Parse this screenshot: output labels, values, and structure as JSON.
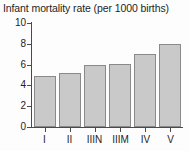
{
  "chart_data": {
    "type": "bar",
    "title": "Infant mortality rate (per 1000 births)",
    "xlabel": "",
    "ylabel": "",
    "categories": [
      "I",
      "II",
      "IIIN",
      "IIIM",
      "IV",
      "V"
    ],
    "values": [
      4.9,
      5.2,
      6.0,
      6.1,
      7.0,
      8.0
    ],
    "ylim": [
      0,
      10
    ],
    "yticks": [
      0,
      2,
      4,
      6,
      8,
      10
    ],
    "ytick_labels": [
      "0",
      "2",
      "4",
      "6",
      "8",
      "10"
    ],
    "grid": false,
    "legend": null,
    "bar_fill_color": "#c9c9c9",
    "bar_edge_color": "#8a8a8a",
    "axis_color": "#4a4a4a",
    "background_color": "#fdfdfd"
  }
}
